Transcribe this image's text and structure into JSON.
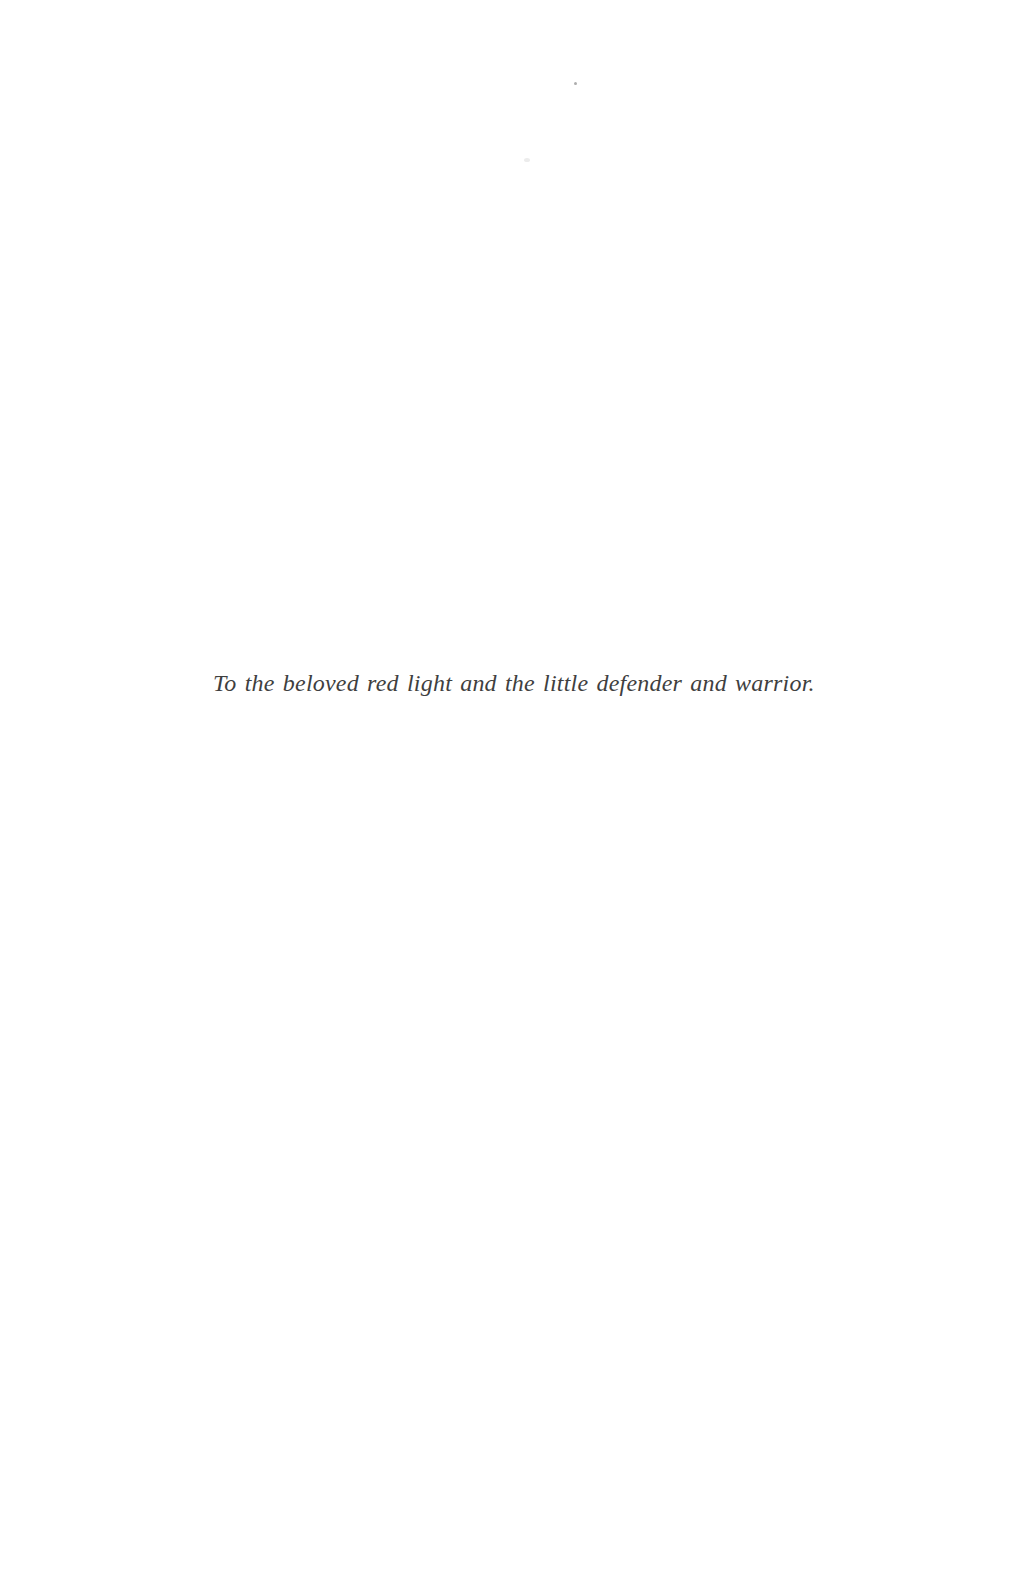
{
  "page": {
    "type": "book-dedication-page",
    "dedication_text": "To the beloved red light and the little defender and warrior.",
    "colors": {
      "background": "#ffffff",
      "text": "#3f3f3f"
    }
  }
}
